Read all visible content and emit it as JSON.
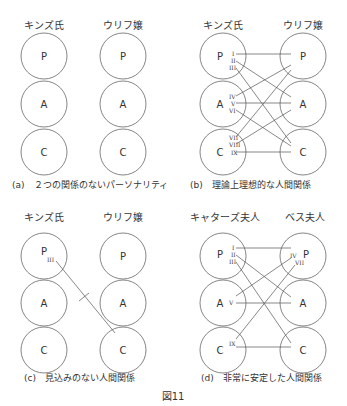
{
  "figure_label": "図11",
  "panels": [
    {
      "id": "a",
      "caption": "(a)　２つの関係のないパーソナリティ",
      "left_person": "キンズ氏",
      "right_person": "ウリフ嬢",
      "left_states": [
        "P",
        "A",
        "C"
      ],
      "right_states": [
        "P",
        "A",
        "C"
      ],
      "transactions": []
    },
    {
      "id": "b",
      "caption": "(b)　理論上理想的な人間関係",
      "left_person": "キンズ氏",
      "right_person": "ウリフ嬢",
      "left_states": [
        "P",
        "A",
        "C"
      ],
      "right_states": [
        "P",
        "A",
        "C"
      ],
      "transactions": [
        {
          "label": "I",
          "from": "P",
          "to": "P"
        },
        {
          "label": "II",
          "from": "P",
          "to": "A"
        },
        {
          "label": "III",
          "from": "P",
          "to": "C"
        },
        {
          "label": "IV",
          "from": "A",
          "to": "P"
        },
        {
          "label": "V",
          "from": "A",
          "to": "A"
        },
        {
          "label": "VI",
          "from": "A",
          "to": "C"
        },
        {
          "label": "VII",
          "from": "C",
          "to": "P"
        },
        {
          "label": "VIII",
          "from": "C",
          "to": "A"
        },
        {
          "label": "IX",
          "from": "C",
          "to": "C"
        }
      ]
    },
    {
      "id": "c",
      "caption": "(c)　見込みのない人間関係",
      "left_person": "キンズ氏",
      "right_person": "ウリフ嬢",
      "left_states": [
        "P",
        "A",
        "C"
      ],
      "right_states": [
        "P",
        "A",
        "C"
      ],
      "transactions": [
        {
          "label": "III",
          "from": "P",
          "to": "C",
          "crossed": true
        }
      ]
    },
    {
      "id": "d",
      "caption": "(d)　非常に安定した人間関係",
      "left_person": "キャターズ夫人",
      "right_person": "ベス夫人",
      "left_states": [
        "P",
        "A",
        "C"
      ],
      "right_states": [
        "P",
        "A",
        "C"
      ],
      "transactions": [
        {
          "label": "I",
          "from": "P",
          "to": "P"
        },
        {
          "label": "II",
          "from": "P",
          "to": "A"
        },
        {
          "label": "III",
          "from": "P",
          "to": "C"
        },
        {
          "label": "IV",
          "from": "P",
          "to": "P",
          "origin": "right"
        },
        {
          "label": "V",
          "from": "A",
          "to": "A"
        },
        {
          "label": "VII",
          "from": "P",
          "to": "C",
          "origin": "right"
        },
        {
          "label": "IX",
          "from": "C",
          "to": "C"
        }
      ]
    }
  ]
}
